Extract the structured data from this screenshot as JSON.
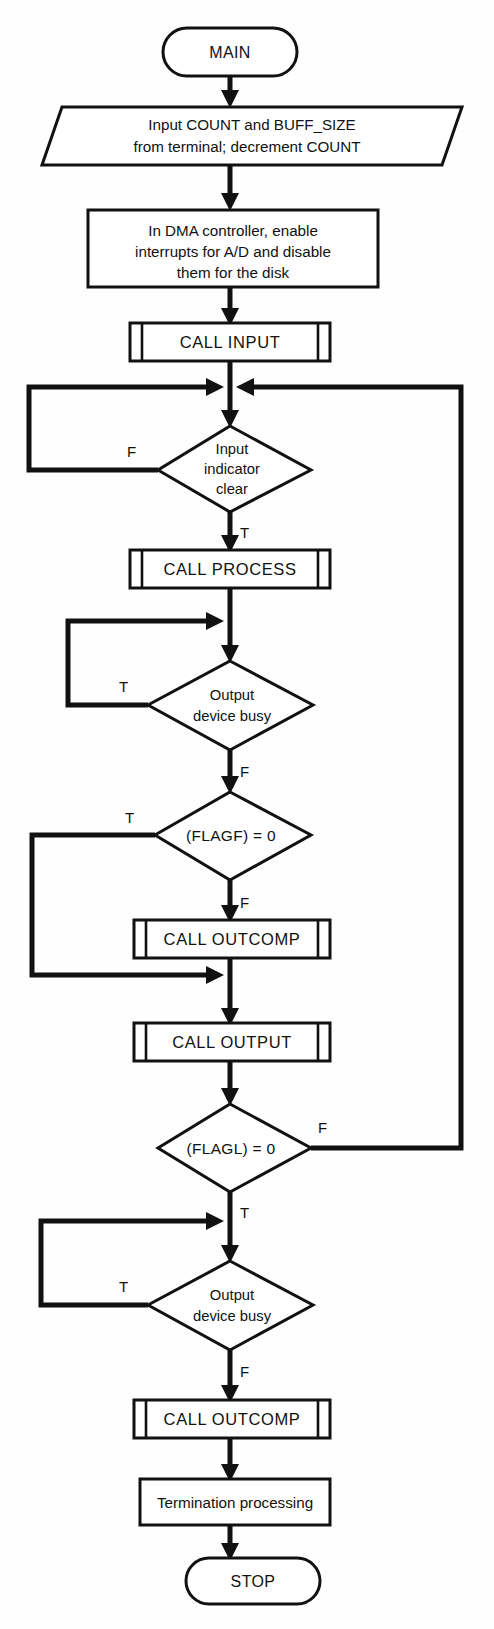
{
  "diagram": {
    "type": "flowchart",
    "line_color": "#111111",
    "fill_color": "#ffffff"
  },
  "nodes": {
    "start": {
      "label": "MAIN",
      "shape": "terminator"
    },
    "input_io": {
      "line1": "Input COUNT and BUFF_SIZE",
      "line2": "from terminal; decrement COUNT",
      "shape": "input-output"
    },
    "dma": {
      "line1": "In DMA controller, enable",
      "line2": "interrupts for A/D and disable",
      "line3": "them for the disk",
      "shape": "process"
    },
    "call_input": {
      "label": "CALL INPUT",
      "shape": "predefined-process"
    },
    "dec_input_ind": {
      "line1": "Input",
      "line2": "indicator",
      "line3": "clear",
      "shape": "decision"
    },
    "call_process": {
      "label": "CALL PROCESS",
      "shape": "predefined-process"
    },
    "dec_out_busy_1": {
      "line1": "Output",
      "line2": "device busy",
      "shape": "decision"
    },
    "dec_flagf": {
      "label": "(FLAGF) = 0",
      "shape": "decision"
    },
    "call_outcomp_1": {
      "label": "CALL OUTCOMP",
      "shape": "predefined-process"
    },
    "call_output": {
      "label": "CALL OUTPUT",
      "shape": "predefined-process"
    },
    "dec_flagl": {
      "label": "(FLAGL) = 0",
      "shape": "decision"
    },
    "dec_out_busy_2": {
      "line1": "Output",
      "line2": "device busy",
      "shape": "decision"
    },
    "call_outcomp_2": {
      "label": "CALL OUTCOMP",
      "shape": "predefined-process"
    },
    "termination": {
      "label": "Termination processing",
      "shape": "process"
    },
    "stop": {
      "label": "STOP",
      "shape": "terminator"
    }
  },
  "branch_labels": {
    "input_ind_false": "F",
    "input_ind_true": "T",
    "out_busy_1_true": "T",
    "out_busy_1_false": "F",
    "flagf_true": "T",
    "flagf_false": "F",
    "flagl_false": "F",
    "flagl_true": "T",
    "out_busy_2_true": "T",
    "out_busy_2_false": "F"
  }
}
